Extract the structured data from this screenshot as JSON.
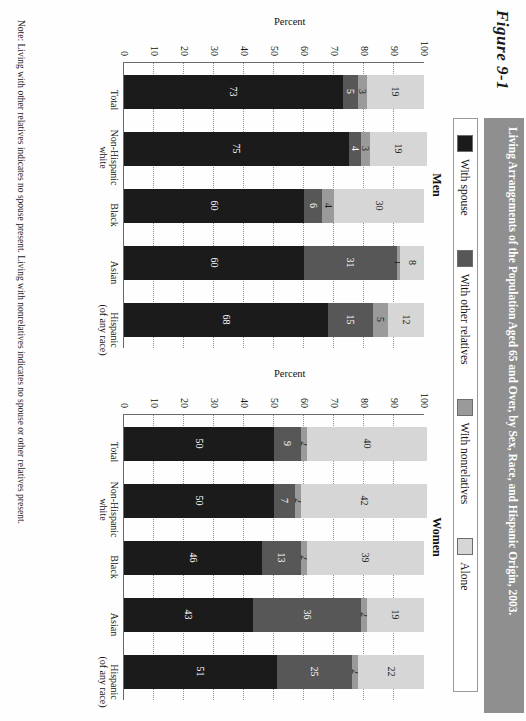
{
  "figure": {
    "number": "Figure 9-1",
    "title": "Living Arrangements of the Population Aged 65 and Over, by Sex, Race, and Hispanic Origin, 2003.",
    "note": "Note: Living with other relatives indicates no spouse present. Living with nonrelatives indicates no spouse or other relatives present."
  },
  "legend": {
    "items": [
      {
        "label": "With spouse",
        "color": "#1b1b1b"
      },
      {
        "label": "With other relatives",
        "color": "#575757"
      },
      {
        "label": "With nonrelatives",
        "color": "#9a9a9a"
      },
      {
        "label": "Alone",
        "color": "#d6d6d6"
      }
    ]
  },
  "axis": {
    "ylabel": "Percent",
    "ticks": [
      "100",
      "90",
      "80",
      "70",
      "60",
      "50",
      "40",
      "30",
      "20",
      "10",
      "0"
    ],
    "ymin": 0,
    "ymax": 100
  },
  "chart_data": {
    "type": "bar",
    "title": "Living Arrangements of the Population Aged 65 and Over, by Sex, Race, and Hispanic Origin, 2003.",
    "xlabel": "",
    "ylabel": "Percent",
    "ylim": [
      0,
      100
    ],
    "grid": true,
    "stacked": true,
    "legend_position": "top",
    "categories": [
      "Total",
      "Non-Hispanic white",
      "Black",
      "Asian",
      "Hispanic (of any race)"
    ],
    "panels": [
      {
        "name": "Men",
        "series": [
          {
            "name": "With spouse",
            "values": [
              73,
              75,
              60,
              60,
              68
            ]
          },
          {
            "name": "With other relatives",
            "values": [
              5,
              4,
              6,
              31,
              15
            ]
          },
          {
            "name": "With nonrelatives",
            "values": [
              3,
              3,
              4,
              1,
              5
            ]
          },
          {
            "name": "Alone",
            "values": [
              19,
              19,
              30,
              8,
              12
            ]
          }
        ]
      },
      {
        "name": "Women",
        "series": [
          {
            "name": "With spouse",
            "values": [
              50,
              50,
              46,
              43,
              51
            ]
          },
          {
            "name": "With other relatives",
            "values": [
              9,
              7,
              13,
              36,
              25
            ]
          },
          {
            "name": "With nonrelatives",
            "values": [
              2,
              2,
              2,
              2,
              2
            ]
          },
          {
            "name": "Alone",
            "values": [
              40,
              42,
              39,
              19,
              22
            ]
          }
        ]
      }
    ]
  }
}
